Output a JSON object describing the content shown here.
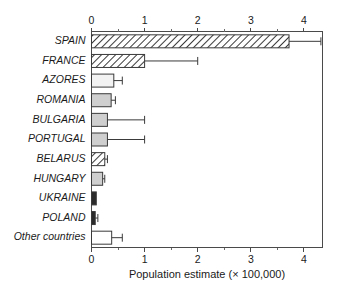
{
  "chart_data": {
    "type": "bar",
    "orientation": "horizontal",
    "title": "",
    "xlabel": "Population estimate (× 100,000)",
    "ylabel": "",
    "xlim": [
      0,
      4.35
    ],
    "xticks": [
      0,
      1,
      2,
      3,
      4
    ],
    "xtick_labels": [
      "0",
      "1",
      "2",
      "3",
      "4"
    ],
    "minor_xticks": [
      0.5,
      1.5,
      2.5,
      3.5
    ],
    "grid": false,
    "legend": "none",
    "axis_top": true,
    "axis_bottom": true,
    "categories": [
      "SPAIN",
      "FRANCE",
      "AZORES",
      "ROMANIA",
      "BULGARIA",
      "PORTUGAL",
      "BELARUS",
      "HUNGARY",
      "UKRAINE",
      "POLAND",
      "Other countries"
    ],
    "values": [
      3.72,
      1.0,
      0.42,
      0.37,
      0.3,
      0.3,
      0.25,
      0.21,
      0.09,
      0.07,
      0.38
    ],
    "error_high": [
      4.32,
      2.0,
      0.58,
      0.45,
      1.0,
      1.0,
      0.3,
      0.25,
      0.09,
      0.12,
      0.58
    ],
    "error_low": [
      3.72,
      1.0,
      0.42,
      0.37,
      0.3,
      0.3,
      0.25,
      0.21,
      0.09,
      0.07,
      0.38
    ],
    "fills": [
      "hatch-diagonal",
      "hatch-diagonal",
      "#f2f2f2",
      "#cfcfcf",
      "#cfcfcf",
      "#cfcfcf",
      "hatch-diagonal",
      "#cfcfcf",
      "#2b2b2b",
      "#2b2b2b",
      "#ffffff"
    ],
    "colors": {
      "axis": "#4a4a4a",
      "bar_edge": "#3a3a3a",
      "bar_light": "#cfcfcf",
      "bar_dark": "#2b2b2b",
      "bar_white": "#ffffff",
      "bar_offwhite": "#f2f2f2",
      "background": "#ffffff"
    }
  }
}
